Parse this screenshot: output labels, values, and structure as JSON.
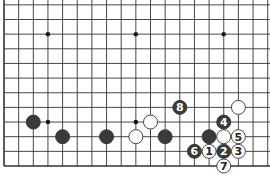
{
  "diagram": {
    "type": "go-board",
    "board_size": 19,
    "visible_region": "bottom rows 1-12, all columns",
    "grid": {
      "origin_x": 4,
      "origin_y": 166,
      "spacing": 14.65
    },
    "star_points": [
      [
        4,
        4
      ],
      [
        10,
        4
      ],
      [
        4,
        10
      ],
      [
        10,
        10
      ],
      [
        16,
        10
      ]
    ],
    "stones": [
      {
        "color": "black",
        "col": 3,
        "row": 4,
        "label": ""
      },
      {
        "color": "black",
        "col": 5,
        "row": 3,
        "label": ""
      },
      {
        "color": "black",
        "col": 8,
        "row": 3,
        "label": ""
      },
      {
        "color": "white",
        "col": 10,
        "row": 3,
        "label": ""
      },
      {
        "color": "white",
        "col": 11,
        "row": 4,
        "label": ""
      },
      {
        "color": "black",
        "col": 12,
        "row": 3,
        "label": ""
      },
      {
        "color": "black",
        "col": 13,
        "row": 5,
        "label": "8"
      },
      {
        "color": "white",
        "col": 17,
        "row": 5,
        "label": ""
      },
      {
        "color": "black",
        "col": 16,
        "row": 4,
        "label": "4"
      },
      {
        "color": "black",
        "col": 15,
        "row": 3,
        "label": ""
      },
      {
        "color": "white",
        "col": 16,
        "row": 3,
        "label": ""
      },
      {
        "color": "white",
        "col": 17,
        "row": 3,
        "label": "5"
      },
      {
        "color": "black",
        "col": 14,
        "row": 2,
        "label": "6"
      },
      {
        "color": "white",
        "col": 15,
        "row": 2,
        "label": "1"
      },
      {
        "color": "black",
        "col": 16,
        "row": 2,
        "label": "2"
      },
      {
        "color": "white",
        "col": 17,
        "row": 2,
        "label": "3"
      },
      {
        "color": "white",
        "col": 16,
        "row": 1,
        "label": "7"
      }
    ],
    "colors": {
      "line": "#333333",
      "black_stone": "#3a3a3a",
      "white_stone": "#ffffff",
      "background": "#ffffff"
    }
  }
}
